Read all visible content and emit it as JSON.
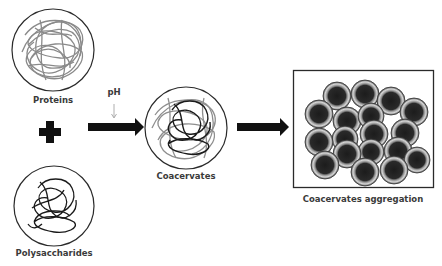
{
  "diagram": {
    "nodes": [
      {
        "id": "proteins",
        "label": "Proteins",
        "shape": "circle",
        "fill": "gray-coil"
      },
      {
        "id": "polysaccharides",
        "label": "Polysaccharides",
        "shape": "circle",
        "fill": "black-coil"
      },
      {
        "id": "coacervates",
        "label": "Coacervates",
        "shape": "circle",
        "fill": "mixed-coil"
      },
      {
        "id": "aggregation",
        "label": "Coacervates aggregation",
        "shape": "box",
        "fill": "clustered-spheres",
        "sphere_count": 18
      }
    ],
    "operators": [
      {
        "id": "plus",
        "symbol": "+",
        "between": [
          "proteins",
          "polysaccharides"
        ]
      }
    ],
    "edges": [
      {
        "from": "proteins+polysaccharides",
        "to": "coacervates",
        "label": "pH",
        "style": "thick-arrow"
      },
      {
        "from": "coacervates",
        "to": "aggregation",
        "label": "",
        "style": "thick-arrow"
      }
    ],
    "trigger": {
      "label": "pH",
      "style": "thin-down-arrow"
    }
  },
  "labels": {
    "proteins": "Proteins",
    "polysaccharides": "Polysaccharides",
    "coacervates": "Coacervates",
    "aggregation": "Coacervates aggregation",
    "ph": "pH"
  },
  "colors": {
    "protein_coil": "#8a8a8a",
    "polysaccharide_coil": "#1a1a1a",
    "outline": "#2a2a2a",
    "arrow": "#111111",
    "label": "#3a3a3a"
  }
}
